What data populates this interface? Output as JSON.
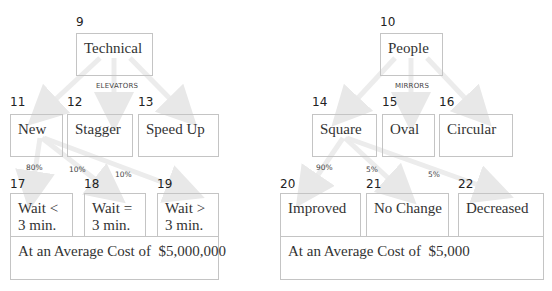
{
  "left_tree": {
    "root": {
      "number": "9",
      "label": "Technical"
    },
    "category_caption": "ELEVATORS",
    "options": [
      {
        "number": "11",
        "label": "New"
      },
      {
        "number": "12",
        "label": "Stagger"
      },
      {
        "number": "13",
        "label": "Speed Up"
      }
    ],
    "probabilities": [
      "80%",
      "10%",
      "10%"
    ],
    "outcomes": [
      {
        "number": "17",
        "line1": "Wait <",
        "line2": "3 min."
      },
      {
        "number": "18",
        "line1": "Wait =",
        "line2": "3 min."
      },
      {
        "number": "19",
        "line1": "Wait >",
        "line2": "3 min."
      }
    ],
    "cost_label": "At an Average Cost of  $5,000,000"
  },
  "right_tree": {
    "root": {
      "number": "10",
      "label": "People"
    },
    "category_caption": "MIRRORS",
    "options": [
      {
        "number": "14",
        "label": "Square"
      },
      {
        "number": "15",
        "label": "Oval"
      },
      {
        "number": "16",
        "label": "Circular"
      }
    ],
    "probabilities": [
      "90%",
      "5%",
      "5%"
    ],
    "outcomes": [
      {
        "number": "20",
        "label": "Improved"
      },
      {
        "number": "21",
        "label": "No Change"
      },
      {
        "number": "22",
        "label": "Decreased"
      }
    ],
    "cost_label": "At an Average Cost of  $5,000"
  },
  "colors": {
    "border": "#c4c4c4",
    "arrow": "#ececec",
    "text": "#333333"
  }
}
